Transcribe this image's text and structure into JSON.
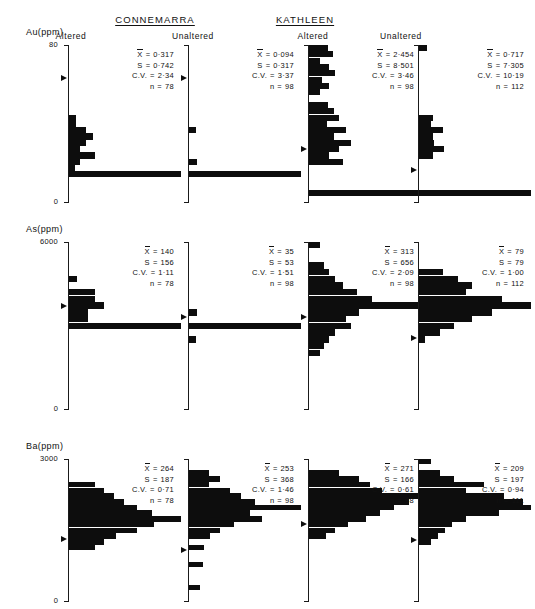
{
  "figure": {
    "groups": [
      {
        "name": "CONNEMARRA",
        "x": 155
      },
      {
        "name": "KATHLEEN",
        "x": 305
      }
    ],
    "columns": [
      {
        "label": "Altered",
        "key": "connemarra_altered"
      },
      {
        "label": "Unaltered",
        "key": "connemarra_unaltered"
      },
      {
        "label": "Altered",
        "key": "kathleen_altered"
      },
      {
        "label": "Unaltered",
        "key": "kathleen_unaltered"
      }
    ],
    "stat_labels": {
      "mean": "X",
      "sd": "S",
      "cv": "C.V.",
      "n": "n"
    },
    "equals": "=",
    "bar_color": "#0d0d0d",
    "axis_color": "#1a1a1a"
  },
  "chart_data": {
    "type": "bar",
    "orientation": "horizontal",
    "xlabel": "Frequency",
    "grid": false,
    "legend": "none",
    "panels": [
      {
        "element": "Au",
        "unit": "ppm",
        "ylabel": "Au(ppm)",
        "ytop": "80",
        "ybot": "0",
        "ylim": [
          0,
          80
        ],
        "columns": [
          {
            "label": "Altered",
            "group": "CONNEMARRA",
            "stats": {
              "mean": "0·317",
              "sd": "0·742",
              "cv": "2·34",
              "n": "78"
            },
            "mean_pos": 0.215,
            "bins": [
              0,
              0,
              0,
              0,
              0,
              0,
              0,
              0,
              0,
              0,
              0,
              0.06,
              0.06,
              0.14,
              0.2,
              0.14,
              0.09,
              0.22,
              0.09,
              0.05,
              0.95,
              0,
              0,
              0,
              0
            ]
          },
          {
            "label": "Unaltered",
            "group": "CONNEMARRA",
            "stats": {
              "mean": "0·094",
              "sd": "0·317",
              "cv": "3·37",
              "n": "98"
            },
            "mean_pos": 0.215,
            "bins": [
              0,
              0,
              0,
              0,
              0,
              0,
              0,
              0,
              0,
              0,
              0,
              0,
              0,
              0.06,
              0,
              0,
              0,
              0,
              0.07,
              0,
              0.95,
              0,
              0,
              0,
              0
            ]
          },
          {
            "label": "Altered",
            "group": "KATHLEEN",
            "stats": {
              "mean": "2·454",
              "sd": "8·501",
              "cv": "3·46",
              "n": "98"
            },
            "mean_pos": 0.66,
            "bins": [
              0.16,
              0.2,
              0.09,
              0.17,
              0.22,
              0.11,
              0.17,
              0.09,
              0,
              0.16,
              0.21,
              0.25,
              0.15,
              0.31,
              0.21,
              0.36,
              0.25,
              0.17,
              0.29,
              0,
              0,
              0,
              0,
              0.95,
              0
            ]
          },
          {
            "label": "Unaltered",
            "group": "KATHLEEN",
            "stats": {
              "mean": "0·717",
              "sd": "7·305",
              "cv": "10·19",
              "n": "112"
            },
            "mean_pos": 0.795,
            "bins": [
              0.07,
              0,
              0,
              0,
              0,
              0,
              0,
              0,
              0,
              0,
              0,
              0.12,
              0.1,
              0.2,
              0.12,
              0.13,
              0.21,
              0.12,
              0,
              0,
              0,
              0,
              0,
              0.95,
              0
            ]
          }
        ]
      },
      {
        "element": "As",
        "unit": "ppm",
        "ylabel": "As(ppm)",
        "ytop": "6000",
        "ybot": "0",
        "ylim": [
          0,
          6000
        ],
        "columns": [
          {
            "label": "Altered",
            "group": "CONNEMARRA",
            "stats": {
              "mean": "140",
              "sd": "156",
              "cv": "1·11",
              "n": "78"
            },
            "mean_pos": 0.385,
            "bins": [
              0,
              0,
              0,
              0,
              0,
              0.07,
              0,
              0.22,
              0.22,
              0.3,
              0.16,
              0.16,
              0.95,
              0,
              0,
              0,
              0,
              0,
              0,
              0,
              0,
              0,
              0,
              0,
              0
            ]
          },
          {
            "label": "Unaltered",
            "group": "CONNEMARRA",
            "stats": {
              "mean": "35",
              "sd": "53",
              "cv": "1·51",
              "n": "98"
            },
            "mean_pos": 0.45,
            "bins": [
              0,
              0,
              0,
              0,
              0,
              0,
              0,
              0,
              0,
              0,
              0.07,
              0,
              0.95,
              0,
              0.06,
              0,
              0,
              0,
              0,
              0,
              0,
              0,
              0,
              0,
              0
            ]
          },
          {
            "label": "Altered",
            "group": "KATHLEEN",
            "stats": {
              "mean": "313",
              "sd": "656",
              "cv": "2·09",
              "n": "98"
            },
            "mean_pos": 0.45,
            "bins": [
              0.09,
              0,
              0,
              0.13,
              0.17,
              0.22,
              0.29,
              0.41,
              0.53,
              0.95,
              0.42,
              0.31,
              0.36,
              0.22,
              0.17,
              0.13,
              0.09,
              0,
              0,
              0,
              0,
              0,
              0,
              0,
              0
            ]
          },
          {
            "label": "Unaltered",
            "group": "KATHLEEN",
            "stats": {
              "mean": "79",
              "sd": "79",
              "cv": "1·00",
              "n": "112"
            },
            "mean_pos": 0.575,
            "bins": [
              0,
              0,
              0,
              0,
              0.2,
              0.33,
              0.45,
              0.4,
              0.7,
              0.95,
              0.62,
              0.45,
              0.3,
              0.18,
              0.05,
              0,
              0,
              0,
              0,
              0,
              0,
              0,
              0,
              0,
              0
            ]
          }
        ]
      },
      {
        "element": "Ba",
        "unit": "ppm",
        "ylabel": "Ba(ppm)",
        "ytop": "3000",
        "ybot": "0",
        "ylim": [
          0,
          3000
        ],
        "columns": [
          {
            "label": "Altered",
            "group": "CONNEMARRA",
            "stats": {
              "mean": "264",
              "sd": "187",
              "cv": "0·71",
              "n": "78"
            },
            "mean_pos": 0.565,
            "bins": [
              0,
              0,
              0,
              0,
              0.22,
              0.3,
              0.38,
              0.47,
              0.58,
              0.7,
              0.95,
              0.72,
              0.58,
              0.4,
              0.3,
              0.22,
              0,
              0,
              0,
              0,
              0,
              0,
              0,
              0,
              0
            ]
          },
          {
            "label": "Unaltered",
            "group": "CONNEMARRA",
            "stats": {
              "mean": "253",
              "sd": "368",
              "cv": "1·46",
              "n": "98"
            },
            "mean_pos": 0.64,
            "bins": [
              0,
              0,
              0.17,
              0.26,
              0.17,
              0.35,
              0.44,
              0.56,
              0.95,
              0.52,
              0.62,
              0.38,
              0.26,
              0.18,
              0,
              0.13,
              0,
              0,
              0.12,
              0,
              0,
              0,
              0.09,
              0,
              0
            ]
          },
          {
            "label": "Altered",
            "group": "KATHLEEN",
            "stats": {
              "mean": "271",
              "sd": "166",
              "cv": "0·61",
              "n": "98"
            },
            "mean_pos": 0.46,
            "bins": [
              0,
              0,
              0.25,
              0.42,
              0.52,
              0.62,
              0.95,
              0.85,
              0.72,
              0.6,
              0.48,
              0.33,
              0.22,
              0.14,
              0,
              0,
              0,
              0,
              0,
              0,
              0,
              0,
              0,
              0,
              0
            ]
          },
          {
            "label": "Unaltered",
            "group": "KATHLEEN",
            "stats": {
              "mean": "209",
              "sd": "197",
              "cv": "0·94",
              "n": "111"
            },
            "mean_pos": 0.57,
            "bins": [
              0.1,
              0,
              0.18,
              0.3,
              0.55,
              0.4,
              0.72,
              0.88,
              0.95,
              0.68,
              0.4,
              0.28,
              0.22,
              0.16,
              0.1,
              0,
              0,
              0,
              0,
              0,
              0,
              0,
              0,
              0,
              0
            ]
          }
        ]
      }
    ]
  }
}
